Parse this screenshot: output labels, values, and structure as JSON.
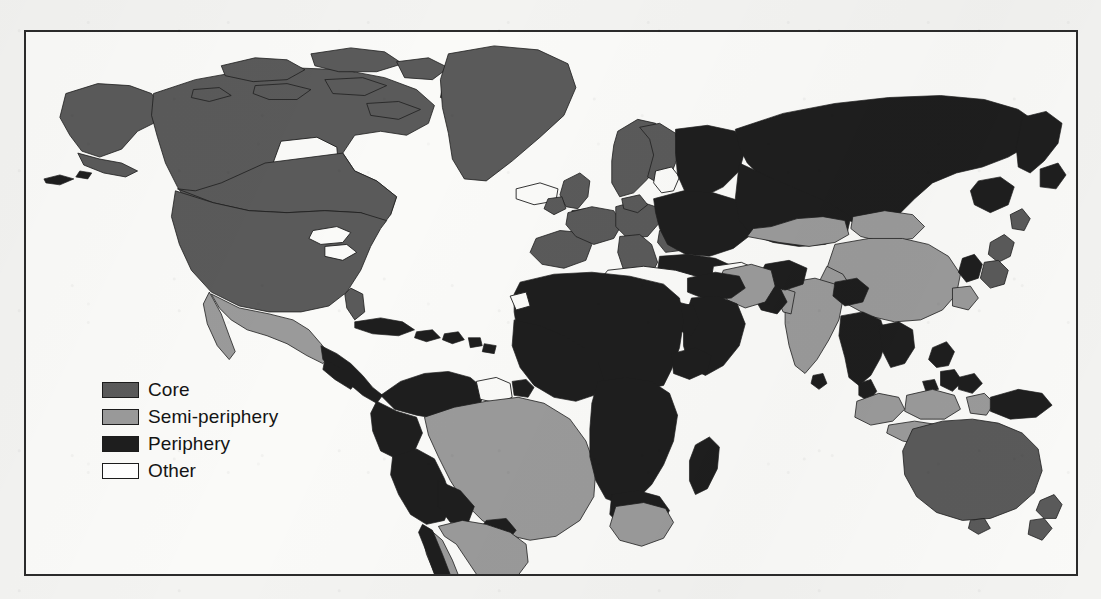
{
  "figure": {
    "kind": "world-map",
    "projection": "equirectangular",
    "frame_border_color": "#2b2b2b",
    "ocean_color": "#fafaf8",
    "background_color": "#f3f3f1"
  },
  "legend": {
    "name": "map-legend",
    "items": [
      {
        "label": "Core",
        "color": "#5a5a5a",
        "key": "core"
      },
      {
        "label": "Semi-periphery",
        "color": "#9a9a9a",
        "key": "semi-periphery"
      },
      {
        "label": "Periphery",
        "color": "#1e1e1e",
        "key": "periphery"
      },
      {
        "label": "Other",
        "color": "#ffffff",
        "key": "other"
      }
    ]
  },
  "classification": {
    "core": [
      "United States",
      "Canada",
      "Greenland",
      "United Kingdom",
      "Ireland",
      "France",
      "Spain",
      "Portugal",
      "Germany",
      "Italy",
      "Netherlands",
      "Belgium",
      "Switzerland",
      "Austria",
      "Denmark",
      "Norway",
      "Sweden",
      "Finland",
      "Japan",
      "Australia",
      "New Zealand"
    ],
    "semi_periphery": [
      "Mexico",
      "Brazil",
      "Argentina",
      "Uruguay",
      "Chile",
      "China",
      "India",
      "Iran",
      "Indonesia",
      "Malaysia",
      "South Africa",
      "Turkey",
      "Kazakhstan",
      "Mongolia",
      "Papua New Guinea coast"
    ],
    "periphery": [
      "Central America",
      "Caribbean",
      "Colombia",
      "Venezuela",
      "Peru",
      "Bolivia",
      "Ecuador",
      "Paraguay",
      "Russia",
      "Eastern Europe",
      "Ukraine",
      "Belarus",
      "Poland",
      "Romania",
      "Balkans",
      "North Africa",
      "Sub-Saharan Africa",
      "Madagascar",
      "Arabian Peninsula",
      "Iraq",
      "Syria",
      "Afghanistan",
      "Pakistan",
      "Bangladesh",
      "Myanmar",
      "Thailand",
      "Vietnam",
      "Laos",
      "Cambodia",
      "Philippines",
      "North Korea",
      "South Korea",
      "Papua New Guinea"
    ],
    "other": [
      "Iceland",
      "Guyana",
      "Suriname",
      "French Guiana",
      "Western Sahara"
    ]
  }
}
